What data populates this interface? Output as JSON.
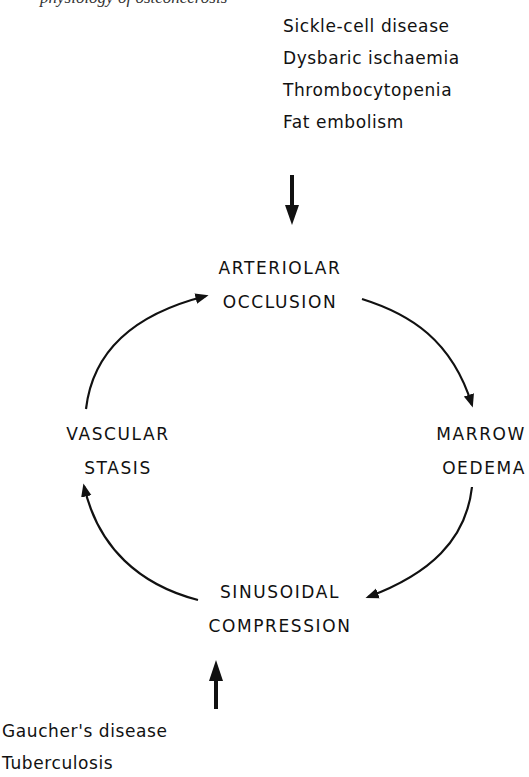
{
  "figure": {
    "cropped_top_caption": "physiology of osteonecrosis",
    "upstream_causes": {
      "items": [
        "Sickle-cell disease",
        "Dysbaric ischaemia",
        "Thrombocytopenia",
        "Fat embolism"
      ],
      "arrow_direction": "down",
      "targets": "ARTERIOLAR OCCLUSION"
    },
    "cycle": {
      "nodes": [
        {
          "id": "arteriolar-occlusion",
          "lines": [
            "ARTERIOLAR",
            "OCCLUSION"
          ]
        },
        {
          "id": "marrow-oedema",
          "lines": [
            "MARROW",
            "OEDEMA"
          ]
        },
        {
          "id": "sinusoidal-compression",
          "lines": [
            "SINUSOIDAL",
            "COMPRESSION"
          ]
        },
        {
          "id": "vascular-stasis",
          "lines": [
            "VASCULAR",
            "STASIS"
          ]
        }
      ],
      "edges": [
        {
          "from": "arteriolar-occlusion",
          "to": "marrow-oedema"
        },
        {
          "from": "marrow-oedema",
          "to": "sinusoidal-compression"
        },
        {
          "from": "sinusoidal-compression",
          "to": "vascular-stasis"
        },
        {
          "from": "vascular-stasis",
          "to": "arteriolar-occlusion"
        }
      ],
      "direction": "clockwise"
    },
    "downstream_causes": {
      "items": [
        "Gaucher's disease",
        "Tuberculosis"
      ],
      "arrow_direction": "up",
      "targets": "SINUSOIDAL COMPRESSION"
    },
    "colors": {
      "ink": "#111111",
      "background": "#ffffff"
    }
  }
}
